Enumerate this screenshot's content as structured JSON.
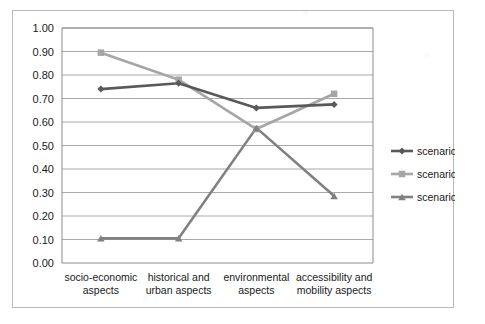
{
  "chart_data": {
    "type": "line",
    "title": "",
    "xlabel": "",
    "ylabel": "",
    "ylim": [
      0.0,
      1.0
    ],
    "ytick_step": 0.1,
    "grid": true,
    "grid_axis": "y",
    "legend_position": "right",
    "categories": [
      "socio-economic aspects",
      "historical and urban aspects",
      "environmental aspects",
      "accessibility and mobility aspects"
    ],
    "category_lines": [
      [
        "socio-economic",
        "aspects"
      ],
      [
        "historical and",
        "urban aspects"
      ],
      [
        "environmental",
        "aspects"
      ],
      [
        "accessibility and",
        "mobility aspects"
      ]
    ],
    "ytick_labels": [
      "0.00",
      "0.10",
      "0.20",
      "0.30",
      "0.40",
      "0.50",
      "0.60",
      "0.70",
      "0.80",
      "0.90",
      "1.00"
    ],
    "ytick_values": [
      0.0,
      0.1,
      0.2,
      0.3,
      0.4,
      0.5,
      0.6,
      0.7,
      0.8,
      0.9,
      1.0
    ],
    "series": [
      {
        "name": "scenario 1",
        "values": [
          0.74,
          0.765,
          0.66,
          0.675
        ],
        "color": "#595959",
        "marker": "diamond"
      },
      {
        "name": "scenario 2",
        "values": [
          0.895,
          0.78,
          0.57,
          0.72
        ],
        "color": "#a6a6a6",
        "marker": "square"
      },
      {
        "name": "scenario 3",
        "values": [
          0.105,
          0.105,
          0.575,
          0.285
        ],
        "color": "#808080",
        "marker": "triangle"
      }
    ]
  },
  "legend": {
    "items": [
      {
        "label": "scenario 1"
      },
      {
        "label": "scenario 2"
      },
      {
        "label": "scenario 3"
      }
    ]
  },
  "colors": {
    "frame_border": "#b9b9b9",
    "plot_border": "#8c8c8c",
    "gridline": "#a9a9a9",
    "scenario_1": "#595959",
    "scenario_2": "#a6a6a6",
    "scenario_3": "#808080",
    "text": "#1a1a1a",
    "background": "#ffffff"
  }
}
